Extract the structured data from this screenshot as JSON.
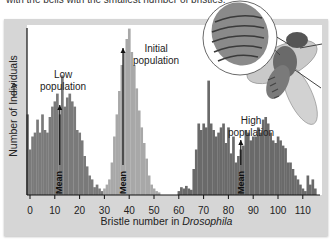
{
  "header": {
    "clipped_text": "with the bells with the smallest number of bristles."
  },
  "chart_data": {
    "type": "bar",
    "title": "",
    "xlabel": "Bristle number in Drosophila",
    "xlabel_plain": "Bristle number in ",
    "xlabel_italic": "Drosophila",
    "ylabel": "Number of Individuals",
    "xlim": [
      -2,
      117
    ],
    "x_ticks": [
      0,
      10,
      20,
      30,
      40,
      50,
      60,
      70,
      80,
      90,
      100,
      110
    ],
    "grid": false,
    "legend": "none",
    "annotations": [
      {
        "text_line1": "Low",
        "text_line2": "population",
        "x": 12
      },
      {
        "text_line1": "Initial",
        "text_line2": "population",
        "x": 48
      },
      {
        "text_line1": "High",
        "text_line2": "population",
        "x": 95
      },
      {
        "text": "Mean",
        "x": 12
      },
      {
        "text": "Mean",
        "x": 37.5
      },
      {
        "text": "Mean",
        "x": 85
      }
    ],
    "series": [
      {
        "name": "Low population",
        "color": "#7a7a7a",
        "x": [
          -1,
          0,
          1,
          2,
          3,
          4,
          5,
          6,
          7,
          8,
          9,
          10,
          11,
          12,
          13,
          14,
          15,
          16,
          17,
          18,
          19,
          20,
          21,
          22,
          23,
          24,
          25,
          26,
          27,
          28,
          29
        ],
        "values": [
          62,
          35,
          45,
          48,
          58,
          48,
          62,
          50,
          48,
          60,
          68,
          72,
          78,
          62,
          92,
          68,
          75,
          78,
          72,
          68,
          50,
          48,
          42,
          30,
          22,
          15,
          12,
          6,
          8,
          5,
          3
        ]
      },
      {
        "name": "Initial population",
        "color": "#a8a8a8",
        "x": [
          30,
          31,
          32,
          33,
          34,
          35,
          36,
          37,
          38,
          39,
          40,
          41,
          42,
          43,
          44,
          45,
          46,
          47,
          48,
          49,
          50,
          51,
          52
        ],
        "values": [
          5,
          8,
          12,
          25,
          45,
          62,
          80,
          100,
          110,
          120,
          128,
          110,
          100,
          82,
          65,
          52,
          40,
          28,
          15,
          8,
          5,
          3,
          2
        ]
      },
      {
        "name": "High population",
        "color": "#6a6a6a",
        "x": [
          60,
          61,
          62,
          63,
          64,
          65,
          66,
          67,
          68,
          69,
          70,
          71,
          72,
          73,
          74,
          75,
          76,
          77,
          78,
          79,
          80,
          81,
          82,
          83,
          84,
          85,
          86,
          87,
          88,
          89,
          90,
          91,
          92,
          93,
          94,
          95,
          96,
          97,
          98,
          99,
          100,
          101,
          102,
          103,
          104,
          105,
          106,
          107,
          108,
          109,
          110,
          111,
          112,
          113,
          114,
          115
        ],
        "values": [
          3,
          6,
          5,
          7,
          5,
          4,
          20,
          35,
          55,
          50,
          55,
          52,
          88,
          55,
          50,
          45,
          48,
          52,
          55,
          40,
          52,
          32,
          45,
          25,
          30,
          35,
          38,
          50,
          48,
          42,
          45,
          45,
          52,
          48,
          58,
          60,
          55,
          48,
          42,
          40,
          45,
          42,
          38,
          36,
          25,
          25,
          20,
          15,
          12,
          8,
          5,
          3,
          15,
          8,
          12,
          5
        ]
      }
    ]
  }
}
